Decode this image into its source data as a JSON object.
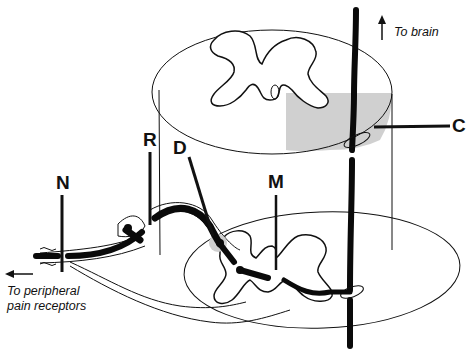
{
  "diagram": {
    "labels": {
      "N": "N",
      "R": "R",
      "D": "D",
      "M": "M",
      "C": "C"
    },
    "annotations": {
      "to_brain": "To brain",
      "to_periphery_line1": "To peripheral",
      "to_periphery_line2": "pain receptors"
    },
    "colors": {
      "line": "#111111",
      "shaded_region": "#c8c8c8",
      "ganglion_highlight": "#cfcfcf",
      "background": "#ffffff"
    }
  }
}
